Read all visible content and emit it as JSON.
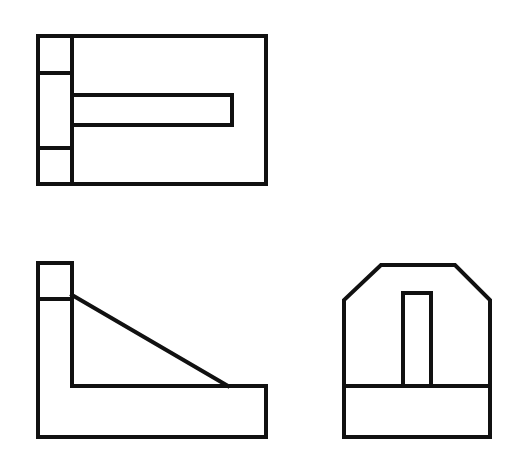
{
  "diagram": {
    "type": "orthographic-projection",
    "views": [
      {
        "name": "top-view"
      },
      {
        "name": "front-view"
      },
      {
        "name": "side-view"
      }
    ],
    "colors": {
      "background": "#ffffff",
      "stroke": "#111111"
    }
  }
}
